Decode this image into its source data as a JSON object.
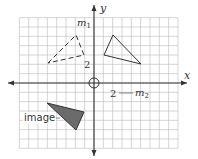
{
  "diagram": {
    "type": "coordinate-plane-transformation",
    "axes": {
      "x_label": "x",
      "y_label": "y"
    },
    "tick_labels": {
      "x": "2",
      "y": "2"
    },
    "grid": {
      "spacing_units": 1,
      "x_range": [
        -8,
        9
      ],
      "y_range": [
        -7,
        7
      ]
    },
    "lines": {
      "m1": "m",
      "m1_sub": "1",
      "m2": "m",
      "m2_sub": "2"
    },
    "shapes": [
      {
        "name": "dashed-triangle",
        "style": "dashed",
        "vertices_px": [
          [
            48,
            63
          ],
          [
            76,
            35
          ],
          [
            84,
            55
          ]
        ]
      },
      {
        "name": "solid-outline-triangle",
        "style": "solid",
        "vertices_px": [
          [
            113,
            35
          ],
          [
            104,
            55
          ],
          [
            141,
            64
          ]
        ]
      },
      {
        "name": "image-triangle",
        "style": "filled",
        "fill": "#6b6b6b",
        "vertices_px": [
          [
            47,
            103
          ],
          [
            84,
            112
          ],
          [
            76,
            130
          ]
        ]
      }
    ],
    "image_label": "image",
    "colors": {
      "grid": "#b9b9b9",
      "axis": "#333333",
      "fill": "#6b6b6b"
    }
  }
}
